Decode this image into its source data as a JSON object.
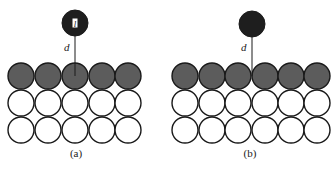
{
  "figure": {
    "panels": [
      {
        "id": "a",
        "caption": "(a)",
        "adatom": {
          "cx": 75,
          "cy": 23,
          "r": 13,
          "label": "l",
          "fill": "#1e1e1e"
        },
        "distance_label": "d",
        "line": {
          "x": 75,
          "y1": 36,
          "y2": 76
        },
        "d_pos": {
          "x": 64,
          "y": 51
        },
        "rows": [
          {
            "cy": 76,
            "fill": "#5c5c5c",
            "cx": [
              21,
              48,
              75,
              102,
              128
            ]
          },
          {
            "cy": 103,
            "fill": "#ffffff",
            "cx": [
              21,
              48,
              75,
              102,
              128
            ]
          },
          {
            "cy": 130,
            "fill": "#ffffff",
            "cx": [
              21,
              48,
              75,
              102,
              128
            ]
          }
        ],
        "atom_r": 13,
        "caption_pos": {
          "x": 76,
          "y": 157
        }
      },
      {
        "id": "b",
        "caption": "(b)",
        "adatom": {
          "cx": 252,
          "cy": 24,
          "r": 13,
          "label": "",
          "fill": "#1e1e1e"
        },
        "distance_label": "d",
        "line": {
          "x": 252,
          "y1": 37,
          "y2": 76
        },
        "d_pos": {
          "x": 241,
          "y": 51
        },
        "rows": [
          {
            "cy": 76,
            "fill": "#5c5c5c",
            "cx": [
              185,
              212,
              238,
              265,
              291,
              317
            ]
          },
          {
            "cy": 103,
            "fill": "#ffffff",
            "cx": [
              185,
              212,
              238,
              265,
              291,
              317
            ]
          },
          {
            "cy": 130,
            "fill": "#ffffff",
            "cx": [
              185,
              212,
              238,
              265,
              291,
              317
            ]
          }
        ],
        "atom_r": 13,
        "caption_pos": {
          "x": 250,
          "y": 157
        }
      }
    ],
    "colors": {
      "stroke": "#1a1a1a",
      "surface_layer": "#5c5c5c",
      "bulk_layer": "#ffffff",
      "adatom": "#1e1e1e"
    }
  }
}
